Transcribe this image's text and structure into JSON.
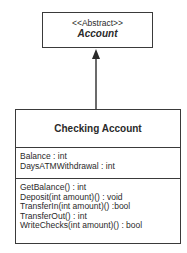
{
  "abstract_class": {
    "stereotype": "<<Abstract>>",
    "name": "Account"
  },
  "relationship": {
    "type": "inheritance",
    "from": "Checking Account",
    "to": "Account"
  },
  "class": {
    "name": "Checking Account",
    "attributes": [
      "Balance : int",
      "DaysATMWithdrawal : int"
    ],
    "operations": [
      "GetBalance() : int",
      "Deposit(int amount)() : void",
      "TransferIn(int amount)() :bool",
      "TransferOut() : int",
      "WriteChecks(int amount)() : bool"
    ]
  },
  "colors": {
    "line": "#3a3a3a",
    "background": "#ffffff"
  }
}
